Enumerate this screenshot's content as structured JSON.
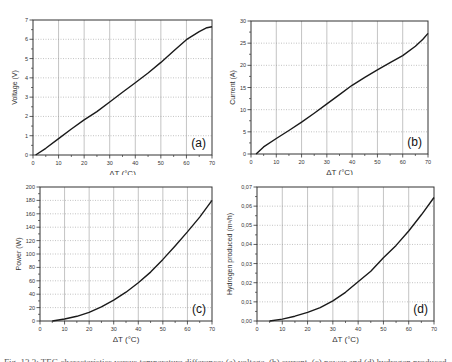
{
  "figure": {
    "caption": "Fig. 13.3: TEG characteristics versus temperature difference: (a) voltage, (b) current, (c) power and (d) hydrogen produced"
  },
  "chart_data": [
    {
      "id": "a",
      "type": "line",
      "panel_label": "(a)",
      "title": "",
      "xlabel": "ΔT (°C)",
      "ylabel": "Voltage (V)",
      "xlim": [
        0,
        70
      ],
      "ylim": [
        0,
        7
      ],
      "xticks": [
        0,
        10,
        20,
        30,
        40,
        50,
        60,
        70
      ],
      "yticks": [
        0,
        1,
        2,
        3,
        4,
        5,
        6,
        7
      ],
      "ytick_labels": [
        "0",
        "1",
        "2",
        "3",
        "4",
        "5",
        "6",
        "7"
      ],
      "grid": true,
      "x": [
        1,
        5,
        10,
        15,
        20,
        25,
        30,
        35,
        40,
        45,
        50,
        55,
        60,
        65,
        68,
        70
      ],
      "y": [
        0,
        0.35,
        0.85,
        1.35,
        1.82,
        2.25,
        2.75,
        3.25,
        3.75,
        4.25,
        4.8,
        5.4,
        5.98,
        6.4,
        6.6,
        6.65
      ]
    },
    {
      "id": "b",
      "type": "line",
      "panel_label": "(b)",
      "title": "",
      "xlabel": "ΔT (°C)",
      "ylabel": "Current (A)",
      "xlim": [
        0,
        70
      ],
      "ylim": [
        0,
        30
      ],
      "xticks": [
        0,
        10,
        20,
        30,
        40,
        50,
        60,
        70
      ],
      "yticks": [
        0,
        5,
        10,
        15,
        20,
        25,
        30
      ],
      "ytick_labels": [
        "0",
        "5",
        "10",
        "15",
        "20",
        "25",
        "30"
      ],
      "grid": true,
      "x": [
        2,
        5,
        10,
        15,
        20,
        25,
        30,
        35,
        40,
        45,
        50,
        55,
        60,
        65,
        68,
        70
      ],
      "y": [
        0,
        1.6,
        3.5,
        5.3,
        7.2,
        9.2,
        11.3,
        13.4,
        15.5,
        17.3,
        19.0,
        20.6,
        22.2,
        24.3,
        25.9,
        27.2
      ]
    },
    {
      "id": "c",
      "type": "line",
      "panel_label": "(c)",
      "title": "",
      "xlabel": "ΔT (°C)",
      "ylabel": "Power (W)",
      "xlim": [
        0,
        70
      ],
      "ylim": [
        0,
        200
      ],
      "xticks": [
        0,
        10,
        20,
        30,
        40,
        50,
        60,
        70
      ],
      "yticks": [
        0,
        20,
        40,
        60,
        80,
        100,
        120,
        140,
        160,
        180,
        200
      ],
      "ytick_labels": [
        "0",
        "20",
        "40",
        "60",
        "80",
        "100",
        "120",
        "140",
        "160",
        "180",
        "200"
      ],
      "grid": true,
      "x": [
        5,
        10,
        15,
        20,
        25,
        30,
        35,
        40,
        45,
        50,
        55,
        60,
        65,
        70
      ],
      "y": [
        0,
        3,
        7,
        13,
        21,
        31,
        43,
        57,
        73,
        92,
        112,
        133,
        155,
        180
      ]
    },
    {
      "id": "d",
      "type": "line",
      "panel_label": "(d)",
      "title": "",
      "xlabel": "ΔT (°C)",
      "ylabel": "Hydrogen produced (m³/h)",
      "xlim": [
        0,
        70
      ],
      "ylim": [
        0,
        0.07
      ],
      "xticks": [
        0,
        10,
        20,
        30,
        40,
        50,
        60,
        70
      ],
      "yticks": [
        0,
        0.01,
        0.02,
        0.03,
        0.04,
        0.05,
        0.06,
        0.07
      ],
      "ytick_labels": [
        "0,00",
        "0,01",
        "0,02",
        "0,03",
        "0,04",
        "0,05",
        "0,06",
        "0,07"
      ],
      "grid": true,
      "x": [
        5,
        10,
        15,
        20,
        25,
        30,
        35,
        40,
        45,
        50,
        55,
        60,
        65,
        70
      ],
      "y": [
        0,
        0.001,
        0.0025,
        0.0045,
        0.007,
        0.0105,
        0.015,
        0.0205,
        0.026,
        0.033,
        0.0395,
        0.047,
        0.0555,
        0.0645
      ]
    }
  ],
  "colors": {
    "line": "#1a1a1a",
    "frame": "#333333",
    "grid": "#9a9a9a",
    "text": "#333333"
  }
}
